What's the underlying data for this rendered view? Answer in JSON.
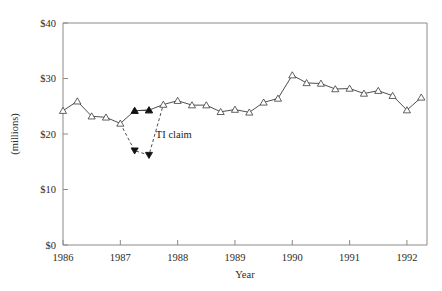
{
  "chart_data": {
    "type": "line",
    "title": "",
    "xlabel": "Year",
    "ylabel": "(millions)",
    "xlim": [
      1986.0,
      1992.35
    ],
    "ylim": [
      0,
      40
    ],
    "grid": false,
    "legend": null,
    "x_ticks": [
      1986,
      1987,
      1988,
      1989,
      1990,
      1991,
      1992
    ],
    "x_tick_labels": [
      "1986",
      "1987",
      "1988",
      "1989",
      "1990",
      "1991",
      "1992"
    ],
    "y_ticks": [
      0,
      10,
      20,
      30,
      40
    ],
    "y_tick_labels": [
      "$0",
      "$10",
      "$20",
      "$30",
      "$40"
    ],
    "annotations": [
      {
        "text": "TI claim",
        "x": 1987.62,
        "y": 19.3
      }
    ],
    "series": [
      {
        "name": "actual",
        "style": "solid",
        "marker": "open-triangle-up",
        "x": [
          1986.0,
          1986.25,
          1986.5,
          1986.75,
          1987.0,
          1987.25,
          1987.5,
          1987.75,
          1988.0,
          1988.25,
          1988.5,
          1988.75,
          1989.0,
          1989.25,
          1989.5,
          1989.75,
          1990.0,
          1990.25,
          1990.5,
          1990.75,
          1991.0,
          1991.25,
          1991.5,
          1991.75,
          1992.0,
          1992.25
        ],
        "values": [
          24.2,
          25.9,
          23.2,
          23.0,
          21.9,
          24.2,
          24.3,
          25.3,
          26.0,
          25.2,
          25.2,
          24.0,
          24.4,
          23.9,
          25.7,
          26.4,
          30.6,
          29.2,
          29.1,
          28.1,
          28.2,
          27.3,
          27.8,
          26.9,
          24.3,
          26.6
        ]
      },
      {
        "name": "ti-claim",
        "style": "dashed",
        "marker": "filled-triangle-down",
        "x": [
          1987.0,
          1987.25,
          1987.5,
          1987.75
        ],
        "values": [
          21.9,
          17.0,
          16.2,
          25.3
        ]
      },
      {
        "name": "actual-highlight",
        "style": "solid",
        "marker": "filled-triangle-up",
        "x": [
          1987.25,
          1987.5
        ],
        "values": [
          24.2,
          24.3
        ]
      }
    ]
  },
  "plot": {
    "left": 63,
    "right": 427,
    "top": 23,
    "bottom": 245
  }
}
